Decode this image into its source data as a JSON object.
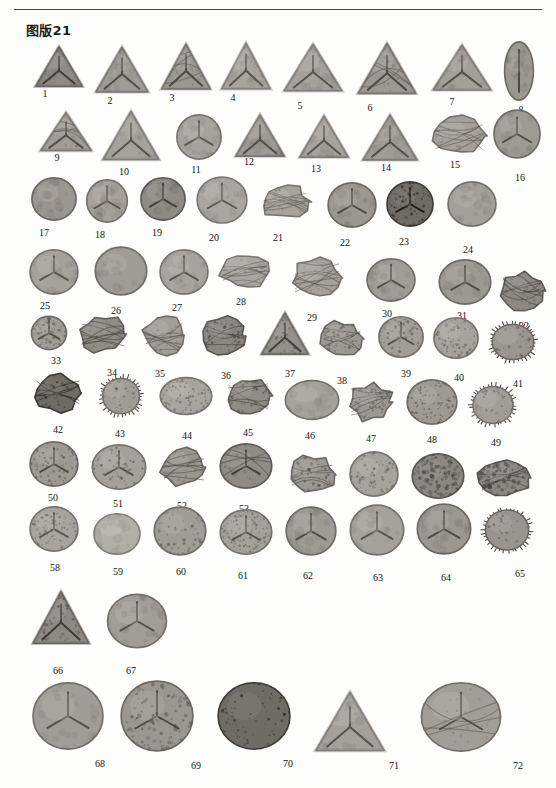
{
  "header": {
    "running_head": "",
    "rule_color": "#4a4a4a"
  },
  "plate": {
    "title": "图版21",
    "background": "#fdfdfc",
    "specimen_count": 72,
    "label_color": "#161616"
  },
  "specimens": [
    {
      "n": "1",
      "x": 33,
      "y": 44,
      "w": 52,
      "h": 46,
      "shape": "trilete-triangular",
      "tone": "#8e8b85",
      "tex": "smooth",
      "lx": 45,
      "ly": 88
    },
    {
      "n": "2",
      "x": 93,
      "y": 44,
      "w": 58,
      "h": 52,
      "shape": "trilete-triangular",
      "tone": "#a09d96",
      "tex": "smooth",
      "lx": 110,
      "ly": 95
    },
    {
      "n": "3",
      "x": 159,
      "y": 41,
      "w": 54,
      "h": 52,
      "shape": "trilete-triangular",
      "tone": "#9b9891",
      "tex": "folded",
      "lx": 172,
      "ly": 92
    },
    {
      "n": "4",
      "x": 219,
      "y": 40,
      "w": 54,
      "h": 53,
      "shape": "trilete-triangular",
      "tone": "#a8a59e",
      "tex": "smooth",
      "lx": 233,
      "ly": 92
    },
    {
      "n": "5",
      "x": 281,
      "y": 41,
      "w": 64,
      "h": 54,
      "shape": "trilete-triangular",
      "tone": "#a5a29b",
      "tex": "smooth",
      "lx": 300,
      "ly": 100
    },
    {
      "n": "6",
      "x": 355,
      "y": 40,
      "w": 64,
      "h": 58,
      "shape": "trilete-triangular",
      "tone": "#9c9992",
      "tex": "folded",
      "lx": 370,
      "ly": 102
    },
    {
      "n": "7",
      "x": 430,
      "y": 42,
      "w": 64,
      "h": 52,
      "shape": "trilete-triangular",
      "tone": "#a3a099",
      "tex": "smooth",
      "lx": 452,
      "ly": 96
    },
    {
      "n": "8",
      "x": 503,
      "y": 40,
      "w": 32,
      "h": 62,
      "shape": "monolete-oval",
      "tone": "#9b9891",
      "tex": "smooth",
      "lx": 521,
      "ly": 104
    },
    {
      "n": "9",
      "x": 38,
      "y": 110,
      "w": 56,
      "h": 44,
      "shape": "trilete-triangular",
      "tone": "#a09d96",
      "tex": "folded",
      "lx": 57,
      "ly": 152
    },
    {
      "n": "10",
      "x": 100,
      "y": 108,
      "w": 62,
      "h": 56,
      "shape": "trilete-triangular",
      "tone": "#a5a29b",
      "tex": "smooth",
      "lx": 124,
      "ly": 166
    },
    {
      "n": "11",
      "x": 175,
      "y": 113,
      "w": 48,
      "h": 48,
      "shape": "trilete-round",
      "tone": "#a7a49d",
      "tex": "smooth",
      "lx": 196,
      "ly": 164
    },
    {
      "n": "12",
      "x": 233,
      "y": 112,
      "w": 54,
      "h": 48,
      "shape": "trilete-triangular",
      "tone": "#9e9b94",
      "tex": "smooth",
      "lx": 249,
      "ly": 156
    },
    {
      "n": "13",
      "x": 297,
      "y": 113,
      "w": 54,
      "h": 48,
      "shape": "trilete-triangular",
      "tone": "#a6a39c",
      "tex": "smooth",
      "lx": 316,
      "ly": 163
    },
    {
      "n": "14",
      "x": 360,
      "y": 112,
      "w": 60,
      "h": 52,
      "shape": "trilete-triangular",
      "tone": "#a09d96",
      "tex": "smooth",
      "lx": 386,
      "ly": 162
    },
    {
      "n": "15",
      "x": 428,
      "y": 113,
      "w": 62,
      "h": 46,
      "shape": "crumpled",
      "tone": "#a4a19a",
      "tex": "folded",
      "lx": 455,
      "ly": 159
    },
    {
      "n": "16",
      "x": 492,
      "y": 108,
      "w": 50,
      "h": 52,
      "shape": "trilete-round",
      "tone": "#9e9b94",
      "tex": "smooth",
      "lx": 520,
      "ly": 172
    },
    {
      "n": "17",
      "x": 30,
      "y": 176,
      "w": 48,
      "h": 46,
      "shape": "round-plain",
      "tone": "#9a9790",
      "tex": "smooth",
      "lx": 44,
      "ly": 227
    },
    {
      "n": "18",
      "x": 85,
      "y": 178,
      "w": 44,
      "h": 46,
      "shape": "trilete-round",
      "tone": "#a4a19a",
      "tex": "smooth",
      "lx": 100,
      "ly": 229
    },
    {
      "n": "19",
      "x": 139,
      "y": 176,
      "w": 48,
      "h": 46,
      "shape": "trilete-round",
      "tone": "#8f8c85",
      "tex": "smooth",
      "lx": 157,
      "ly": 227
    },
    {
      "n": "20",
      "x": 195,
      "y": 175,
      "w": 54,
      "h": 50,
      "shape": "trilete-round",
      "tone": "#a9a69f",
      "tex": "smooth",
      "lx": 214,
      "ly": 232
    },
    {
      "n": "21",
      "x": 257,
      "y": 182,
      "w": 56,
      "h": 40,
      "shape": "crumpled",
      "tone": "#a6a39c",
      "tex": "folded",
      "lx": 278,
      "ly": 232
    },
    {
      "n": "22",
      "x": 326,
      "y": 181,
      "w": 52,
      "h": 48,
      "shape": "trilete-round",
      "tone": "#9b9891",
      "tex": "smooth",
      "lx": 345,
      "ly": 237
    },
    {
      "n": "23",
      "x": 385,
      "y": 180,
      "w": 50,
      "h": 48,
      "shape": "trilete-round",
      "tone": "#6f6c66",
      "tex": "dark",
      "lx": 404,
      "ly": 236
    },
    {
      "n": "24",
      "x": 446,
      "y": 180,
      "w": 52,
      "h": 48,
      "shape": "round-plain",
      "tone": "#a3a099",
      "tex": "smooth",
      "lx": 468,
      "ly": 244
    },
    {
      "n": "25",
      "x": 28,
      "y": 248,
      "w": 52,
      "h": 48,
      "shape": "trilete-round",
      "tone": "#a5a29b",
      "tex": "smooth",
      "lx": 45,
      "ly": 300
    },
    {
      "n": "26",
      "x": 93,
      "y": 245,
      "w": 56,
      "h": 52,
      "shape": "round-plain",
      "tone": "#a09d96",
      "tex": "smooth",
      "lx": 116,
      "ly": 305
    },
    {
      "n": "27",
      "x": 158,
      "y": 248,
      "w": 52,
      "h": 48,
      "shape": "trilete-round",
      "tone": "#a7a49d",
      "tex": "smooth",
      "lx": 177,
      "ly": 302
    },
    {
      "n": "28",
      "x": 216,
      "y": 250,
      "w": 58,
      "h": 42,
      "shape": "crumpled",
      "tone": "#a9a69f",
      "tex": "folded",
      "lx": 241,
      "ly": 296
    },
    {
      "n": "29",
      "x": 288,
      "y": 254,
      "w": 58,
      "h": 48,
      "shape": "crumpled",
      "tone": "#a4a19a",
      "tex": "folded",
      "lx": 312,
      "ly": 312
    },
    {
      "n": "30",
      "x": 365,
      "y": 257,
      "w": 52,
      "h": 46,
      "shape": "trilete-round",
      "tone": "#a09d96",
      "tex": "smooth",
      "lx": 387,
      "ly": 308
    },
    {
      "n": "31",
      "x": 437,
      "y": 258,
      "w": 56,
      "h": 48,
      "shape": "trilete-round",
      "tone": "#9c9992",
      "tex": "smooth",
      "lx": 462,
      "ly": 310
    },
    {
      "n": "32",
      "x": 497,
      "y": 268,
      "w": 50,
      "h": 46,
      "shape": "crumpled",
      "tone": "#8d8a84",
      "tex": "folded",
      "lx": 524,
      "ly": 320
    },
    {
      "n": "33",
      "x": 30,
      "y": 315,
      "w": 38,
      "h": 36,
      "shape": "trilete-round",
      "tone": "#a09d96",
      "tex": "granular",
      "lx": 56,
      "ly": 355
    },
    {
      "n": "34",
      "x": 75,
      "y": 312,
      "w": 56,
      "h": 44,
      "shape": "crumpled",
      "tone": "#8f8c85",
      "tex": "folded",
      "lx": 112,
      "ly": 367
    },
    {
      "n": "35",
      "x": 140,
      "y": 312,
      "w": 48,
      "h": 46,
      "shape": "crumpled",
      "tone": "#a19e97",
      "tex": "folded",
      "lx": 160,
      "ly": 368
    },
    {
      "n": "36",
      "x": 200,
      "y": 313,
      "w": 50,
      "h": 46,
      "shape": "crumpled",
      "tone": "#8a8781",
      "tex": "granular",
      "lx": 226,
      "ly": 370
    },
    {
      "n": "37",
      "x": 259,
      "y": 310,
      "w": 52,
      "h": 48,
      "shape": "trilete-triangular",
      "tone": "#93908a",
      "tex": "granular",
      "lx": 290,
      "ly": 368
    },
    {
      "n": "38",
      "x": 318,
      "y": 318,
      "w": 48,
      "h": 42,
      "shape": "crumpled",
      "tone": "#9c9992",
      "tex": "granular",
      "lx": 342,
      "ly": 375
    },
    {
      "n": "39",
      "x": 377,
      "y": 315,
      "w": 48,
      "h": 44,
      "shape": "trilete-round",
      "tone": "#a19e97",
      "tex": "granular",
      "lx": 406,
      "ly": 368
    },
    {
      "n": "40",
      "x": 432,
      "y": 316,
      "w": 48,
      "h": 44,
      "shape": "round-plain",
      "tone": "#a6a39c",
      "tex": "granular",
      "lx": 459,
      "ly": 372
    },
    {
      "n": "41",
      "x": 487,
      "y": 320,
      "w": 52,
      "h": 44,
      "shape": "echinate",
      "tone": "#9a9790",
      "tex": "spiny",
      "lx": 518,
      "ly": 378
    },
    {
      "n": "42",
      "x": 30,
      "y": 371,
      "w": 56,
      "h": 44,
      "shape": "crumpled",
      "tone": "#6e6b65",
      "tex": "dark",
      "lx": 58,
      "ly": 424
    },
    {
      "n": "43",
      "x": 98,
      "y": 374,
      "w": 46,
      "h": 44,
      "shape": "echinate",
      "tone": "#a09d96",
      "tex": "spiny",
      "lx": 120,
      "ly": 428
    },
    {
      "n": "44",
      "x": 158,
      "y": 376,
      "w": 56,
      "h": 40,
      "shape": "round-plain",
      "tone": "#a8a59e",
      "tex": "punctate",
      "lx": 187,
      "ly": 430
    },
    {
      "n": "45",
      "x": 222,
      "y": 374,
      "w": 52,
      "h": 44,
      "shape": "crumpled",
      "tone": "#8f8c85",
      "tex": "granular",
      "lx": 248,
      "ly": 427
    },
    {
      "n": "46",
      "x": 283,
      "y": 379,
      "w": 58,
      "h": 42,
      "shape": "round-plain",
      "tone": "#a5a29b",
      "tex": "smooth",
      "lx": 310,
      "ly": 430
    },
    {
      "n": "47",
      "x": 345,
      "y": 380,
      "w": 52,
      "h": 44,
      "shape": "crumpled",
      "tone": "#9b9891",
      "tex": "granular",
      "lx": 371,
      "ly": 433
    },
    {
      "n": "48",
      "x": 405,
      "y": 378,
      "w": 54,
      "h": 48,
      "shape": "round-plain",
      "tone": "#9e9b94",
      "tex": "punctate",
      "lx": 432,
      "ly": 434
    },
    {
      "n": "49",
      "x": 468,
      "y": 382,
      "w": 50,
      "h": 46,
      "shape": "echinate",
      "tone": "#a19e97",
      "tex": "spiny",
      "lx": 496,
      "ly": 437
    },
    {
      "n": "50",
      "x": 28,
      "y": 440,
      "w": 52,
      "h": 48,
      "shape": "trilete-round",
      "tone": "#9d9a93",
      "tex": "granular",
      "lx": 53,
      "ly": 492
    },
    {
      "n": "51",
      "x": 90,
      "y": 443,
      "w": 58,
      "h": 48,
      "shape": "trilete-round",
      "tone": "#a4a19a",
      "tex": "granular",
      "lx": 118,
      "ly": 498
    },
    {
      "n": "52",
      "x": 158,
      "y": 444,
      "w": 52,
      "h": 46,
      "shape": "crumpled",
      "tone": "#9a9790",
      "tex": "folded",
      "lx": 182,
      "ly": 500
    },
    {
      "n": "53",
      "x": 218,
      "y": 442,
      "w": 56,
      "h": 48,
      "shape": "trilete-round",
      "tone": "#8f8c85",
      "tex": "folded",
      "lx": 244,
      "ly": 503
    },
    {
      "n": "54",
      "x": 285,
      "y": 452,
      "w": 54,
      "h": 46,
      "shape": "crumpled",
      "tone": "#9b9891",
      "tex": "granular",
      "lx": 310,
      "ly": 509
    },
    {
      "n": "55",
      "x": 348,
      "y": 450,
      "w": 52,
      "h": 48,
      "shape": "round-plain",
      "tone": "#a6a39c",
      "tex": "granular",
      "lx": 377,
      "ly": 508
    },
    {
      "n": "56",
      "x": 410,
      "y": 452,
      "w": 56,
      "h": 48,
      "shape": "round-plain",
      "tone": "#8a8781",
      "tex": "coarse",
      "lx": 436,
      "ly": 512
    },
    {
      "n": "57",
      "x": 475,
      "y": 456,
      "w": 58,
      "h": 44,
      "shape": "crumpled",
      "tone": "#8c8983",
      "tex": "coarse",
      "lx": 512,
      "ly": 517
    },
    {
      "n": "58",
      "x": 28,
      "y": 505,
      "w": 52,
      "h": 48,
      "shape": "trilete-round",
      "tone": "#a7a49d",
      "tex": "granular",
      "lx": 55,
      "ly": 562
    },
    {
      "n": "59",
      "x": 92,
      "y": 512,
      "w": 50,
      "h": 44,
      "shape": "round-plain",
      "tone": "#b2afa8",
      "tex": "smooth",
      "lx": 118,
      "ly": 566
    },
    {
      "n": "60",
      "x": 152,
      "y": 505,
      "w": 56,
      "h": 52,
      "shape": "round-plain",
      "tone": "#a09d96",
      "tex": "granular",
      "lx": 181,
      "ly": 566
    },
    {
      "n": "61",
      "x": 218,
      "y": 508,
      "w": 56,
      "h": 48,
      "shape": "trilete-round",
      "tone": "#a4a19a",
      "tex": "punctate",
      "lx": 243,
      "ly": 570
    },
    {
      "n": "62",
      "x": 284,
      "y": 505,
      "w": 54,
      "h": 52,
      "shape": "trilete-round",
      "tone": "#9e9b94",
      "tex": "smooth",
      "lx": 308,
      "ly": 570
    },
    {
      "n": "63",
      "x": 348,
      "y": 503,
      "w": 58,
      "h": 54,
      "shape": "trilete-round",
      "tone": "#a5a29b",
      "tex": "smooth",
      "lx": 378,
      "ly": 572
    },
    {
      "n": "64",
      "x": 415,
      "y": 502,
      "w": 58,
      "h": 54,
      "shape": "trilete-round",
      "tone": "#9b9891",
      "tex": "smooth",
      "lx": 446,
      "ly": 572
    },
    {
      "n": "65",
      "x": 480,
      "y": 505,
      "w": 54,
      "h": 50,
      "shape": "echinate",
      "tone": "#989590",
      "tex": "spiny",
      "lx": 520,
      "ly": 568
    },
    {
      "n": "66",
      "x": 30,
      "y": 588,
      "w": 62,
      "h": 60,
      "shape": "trilete-triangular",
      "tone": "#8d8a84",
      "tex": "granular",
      "lx": 58,
      "ly": 665
    },
    {
      "n": "67",
      "x": 105,
      "y": 592,
      "w": 64,
      "h": 58,
      "shape": "trilete-round",
      "tone": "#a19e97",
      "tex": "smooth",
      "lx": 131,
      "ly": 665
    },
    {
      "n": "68",
      "x": 185,
      "y": 595,
      "w": 58,
      "h": 54,
      "shape": "round-plain",
      "tone": "#a8a59e",
      "tex": "smooth",
      "lx": 208,
      "ly": 668
    },
    {
      "n": "69",
      "x": 255,
      "y": 592,
      "w": 62,
      "h": 58,
      "shape": "round-plain",
      "tone": "#a5a29b",
      "tex": "smooth",
      "lx": 292,
      "ly": 670
    },
    {
      "n": "70",
      "x": 340,
      "y": 598,
      "w": 58,
      "h": 56,
      "shape": "round-plain",
      "tone": "#8e8b85",
      "tex": "smooth",
      "lx": 360,
      "ly": 676
    },
    {
      "n": "71",
      "x": 410,
      "y": 596,
      "w": 62,
      "h": 58,
      "shape": "round-plain",
      "tone": "#96938d",
      "tex": "smooth",
      "lx": 443,
      "ly": 678
    },
    {
      "n": "72",
      "x": 478,
      "y": 588,
      "w": 62,
      "h": 60,
      "shape": "echinate",
      "tone": "#9d9a93",
      "tex": "spiny",
      "lx": 516,
      "ly": 672
    }
  ],
  "bottom_specimens": [
    {
      "n": "68b",
      "x": 30,
      "y": 680,
      "w": 76,
      "h": 72,
      "shape": "trilete-round",
      "tone": "#a09d96",
      "tex": "smooth",
      "lx": 100,
      "ly": 758
    },
    {
      "n": "69b",
      "x": 118,
      "y": 678,
      "w": 78,
      "h": 76,
      "shape": "trilete-round",
      "tone": "#9a9790",
      "tex": "coarse",
      "lx": 196,
      "ly": 760
    },
    {
      "n": "70b",
      "x": 215,
      "y": 680,
      "w": 78,
      "h": 72,
      "shape": "round-plain",
      "tone": "#6f6c66",
      "tex": "dark",
      "lx": 288,
      "ly": 758
    },
    {
      "n": "71b",
      "x": 312,
      "y": 688,
      "w": 76,
      "h": 68,
      "shape": "trilete-triangular",
      "tone": "#a4a19a",
      "tex": "smooth",
      "lx": 394,
      "ly": 760
    },
    {
      "n": "72b",
      "x": 418,
      "y": 680,
      "w": 86,
      "h": 74,
      "shape": "trilete-round",
      "tone": "#a19e97",
      "tex": "folded",
      "lx": 518,
      "ly": 760
    }
  ],
  "bottom_labels": [
    "68",
    "69",
    "70",
    "71",
    "72"
  ]
}
